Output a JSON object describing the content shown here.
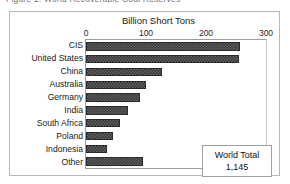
{
  "caption": {
    "text": "Figure 1.  World Recoverable Coal Reserves"
  },
  "annotation": {
    "title": "World Total",
    "value": "1,145"
  },
  "chart_data": {
    "type": "bar",
    "orientation": "horizontal",
    "title": "",
    "xlabel": "Billion Short Tons",
    "ylabel": "",
    "xlim": [
      0,
      300
    ],
    "ticks": [
      "0",
      "100",
      "200",
      "300"
    ],
    "tick_values": [
      0,
      100,
      200,
      300
    ],
    "grid": false,
    "legend": false,
    "bar_color": "#3b3b3b",
    "categories": [
      "CIS",
      "United States",
      "China",
      "Australia",
      "Germany",
      "India",
      "South Africa",
      "Poland",
      "Indonesia",
      "Other"
    ],
    "values": [
      257,
      255,
      127,
      100,
      90,
      70,
      56,
      45,
      35,
      95
    ],
    "annotations": [
      {
        "label": "World Total",
        "value": "1,145"
      }
    ]
  }
}
